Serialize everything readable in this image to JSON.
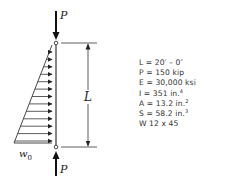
{
  "diagram": {
    "type": "column-with-distributed-lateral-load",
    "load_label_top": "P",
    "load_label_bottom": "P",
    "length_label": "L",
    "distributed_load_label": "w",
    "distributed_load_subscript": "0",
    "num_load_arrows": 13
  },
  "properties": [
    {
      "key": "L",
      "eq": " = ",
      "value": "20′ – 0″",
      "sup": ""
    },
    {
      "key": "P",
      "eq": " = ",
      "value": "150 kip",
      "sup": ""
    },
    {
      "key": "E",
      "eq": " = ",
      "value": "30,000 ksi",
      "sup": ""
    },
    {
      "key": "I",
      "eq": " = ",
      "value": "351 in.",
      "sup": "4"
    },
    {
      "key": "A",
      "eq": " = ",
      "value": "13.2 in.",
      "sup": "2"
    },
    {
      "key": "S",
      "eq": " = ",
      "value": "58.2 in.",
      "sup": "3"
    },
    {
      "key": "W 12 x 45",
      "eq": "",
      "value": "",
      "sup": ""
    }
  ]
}
